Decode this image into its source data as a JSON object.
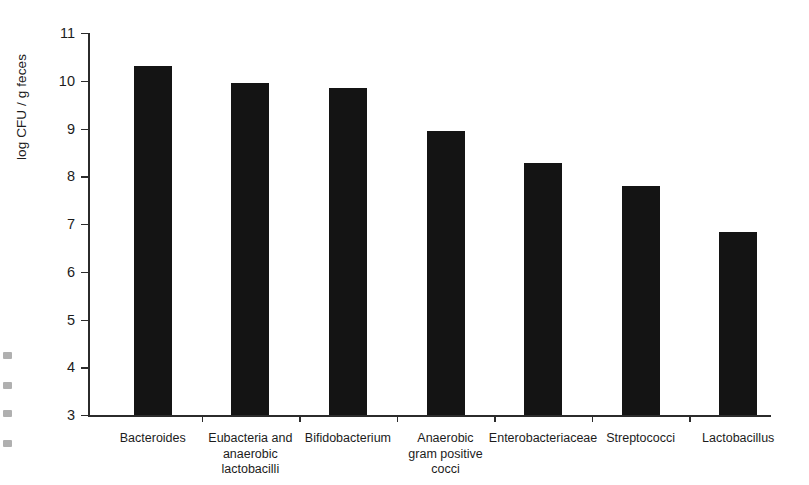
{
  "chart_data": {
    "type": "bar",
    "title": "",
    "xlabel": "",
    "ylabel": "log CFU / g feces",
    "ylim": [
      3,
      11
    ],
    "yticks": [
      3,
      4,
      5,
      6,
      7,
      8,
      9,
      10,
      11
    ],
    "grid": false,
    "legend": null,
    "categories": [
      "Bacteroides",
      "Eubacteria and anaerobic lactobacilli",
      "Bifidobacterium",
      "Anaerobic gram positive cocci",
      "Enterobacteriaceae",
      "Streptococci",
      "Lactobacillus"
    ],
    "values": [
      10.3,
      9.95,
      9.85,
      8.95,
      8.28,
      7.8,
      6.83
    ],
    "bar_color": "#141414",
    "axis_color": "#2b2b2b",
    "background_color": "#ffffff"
  },
  "axis": {
    "y_label": "log CFU / g feces",
    "y_tick_labels": [
      "11",
      "10",
      "9",
      "8",
      "7",
      "6",
      "5",
      "4",
      "3"
    ]
  },
  "categories_display": [
    {
      "lines": [
        "Bacteroides"
      ]
    },
    {
      "lines": [
        "Eubacteria and",
        "anaerobic",
        "lactobacilli"
      ]
    },
    {
      "lines": [
        "Bifidobacterium"
      ]
    },
    {
      "lines": [
        "Anaerobic",
        "gram positive",
        "cocci"
      ]
    },
    {
      "lines": [
        "Enterobacteriaceae"
      ]
    },
    {
      "lines": [
        "Streptococci"
      ]
    },
    {
      "lines": [
        "Lactobacillus"
      ]
    }
  ]
}
